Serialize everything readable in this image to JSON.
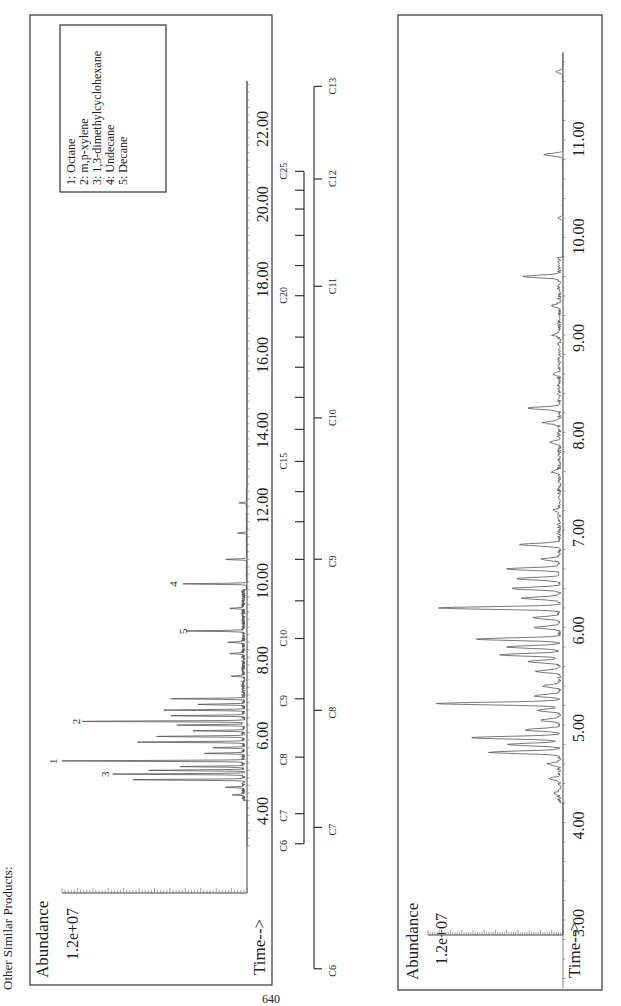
{
  "page": {
    "heading": "Other Similar Products:",
    "page_number": "640"
  },
  "chart_data": [
    {
      "type": "line",
      "title": "Total ion chromatogram (full run)",
      "ylabel": "Abundance",
      "xlabel": "Time-->",
      "y_tick_label": "1.2e+07",
      "ylim": [
        0,
        12000000
      ],
      "xlim": [
        3.0,
        23.3
      ],
      "x_ticks": [
        "4.00",
        "6.00",
        "8.00",
        "10.00",
        "12.00",
        "14.00",
        "16.00",
        "18.00",
        "20.00",
        "22.00"
      ],
      "legend": {
        "position": "top-right (rotated)",
        "entries": [
          "1: Octane",
          "2: m,p-xylene",
          "3: 1,3-dimethylcyclohexane",
          "4: Undecane",
          "5: Decane"
        ]
      },
      "labeled_peaks": [
        {
          "label": "1",
          "time": 5.25,
          "abundance": 12000000
        },
        {
          "label": "2",
          "time": 6.3,
          "abundance": 10500000
        },
        {
          "label": "3",
          "time": 4.9,
          "abundance": 8600000
        },
        {
          "label": "4",
          "time": 9.95,
          "abundance": 4200000
        },
        {
          "label": "5",
          "time": 8.7,
          "abundance": 3600000
        }
      ],
      "peaks": [
        {
          "time": 4.35,
          "abundance": 700000
        },
        {
          "time": 4.55,
          "abundance": 1200000
        },
        {
          "time": 4.75,
          "abundance": 7300000
        },
        {
          "time": 4.9,
          "abundance": 8600000
        },
        {
          "time": 5.0,
          "abundance": 6200000
        },
        {
          "time": 5.1,
          "abundance": 4000000
        },
        {
          "time": 5.25,
          "abundance": 12000000
        },
        {
          "time": 5.45,
          "abundance": 2600000
        },
        {
          "time": 5.6,
          "abundance": 2000000
        },
        {
          "time": 5.75,
          "abundance": 7000000
        },
        {
          "time": 5.9,
          "abundance": 5800000
        },
        {
          "time": 6.05,
          "abundance": 3200000
        },
        {
          "time": 6.2,
          "abundance": 4400000
        },
        {
          "time": 6.3,
          "abundance": 10500000
        },
        {
          "time": 6.45,
          "abundance": 4800000
        },
        {
          "time": 6.6,
          "abundance": 5100000
        },
        {
          "time": 6.75,
          "abundance": 3000000
        },
        {
          "time": 6.9,
          "abundance": 4600000
        },
        {
          "time": 7.5,
          "abundance": 800000
        },
        {
          "time": 8.1,
          "abundance": 900000
        },
        {
          "time": 8.4,
          "abundance": 1100000
        },
        {
          "time": 8.7,
          "abundance": 3600000
        },
        {
          "time": 9.3,
          "abundance": 900000
        },
        {
          "time": 9.95,
          "abundance": 4200000
        },
        {
          "time": 10.6,
          "abundance": 1400000
        },
        {
          "time": 11.3,
          "abundance": 600000
        },
        {
          "time": 12.1,
          "abundance": 500000
        }
      ],
      "carbon_scale": {
        "labels": [
          "C6",
          "C7",
          "C8",
          "C9",
          "C10",
          "C15",
          "C20",
          "C25"
        ],
        "positions_min": [
          3.05,
          3.85,
          5.35,
          6.9,
          8.5,
          13.2,
          17.6,
          20.9
        ],
        "minor_ticks_min": [
          9.5,
          10.6,
          11.6,
          12.4,
          14.05,
          14.9,
          15.7,
          16.5,
          18.4,
          19.2,
          19.9,
          20.4
        ]
      }
    },
    {
      "type": "line",
      "title": "Total ion chromatogram (expanded 3-11.8 min)",
      "ylabel": "Abundance",
      "xlabel": "Time-->",
      "y_tick_label": "1.2e+07",
      "ylim": [
        0,
        12000000
      ],
      "xlim": [
        2.3,
        11.9
      ],
      "x_ticks": [
        "3.00",
        "4.00",
        "5.00",
        "6.00",
        "7.00",
        "8.00",
        "9.00",
        "10.00",
        "11.00"
      ],
      "peaks": [
        {
          "time": 4.3,
          "abundance": 500000
        },
        {
          "time": 4.45,
          "abundance": 800000
        },
        {
          "time": 4.6,
          "abundance": 1000000
        },
        {
          "time": 4.72,
          "abundance": 6200000
        },
        {
          "time": 4.8,
          "abundance": 4600000
        },
        {
          "time": 4.87,
          "abundance": 8000000
        },
        {
          "time": 4.95,
          "abundance": 3000000
        },
        {
          "time": 5.05,
          "abundance": 1800000
        },
        {
          "time": 5.15,
          "abundance": 2100000
        },
        {
          "time": 5.22,
          "abundance": 11200000
        },
        {
          "time": 5.3,
          "abundance": 2300000
        },
        {
          "time": 5.4,
          "abundance": 1500000
        },
        {
          "time": 5.55,
          "abundance": 2000000
        },
        {
          "time": 5.65,
          "abundance": 2800000
        },
        {
          "time": 5.72,
          "abundance": 5300000
        },
        {
          "time": 5.8,
          "abundance": 4700000
        },
        {
          "time": 5.88,
          "abundance": 7300000
        },
        {
          "time": 6.0,
          "abundance": 2200000
        },
        {
          "time": 6.1,
          "abundance": 2400000
        },
        {
          "time": 6.2,
          "abundance": 10600000
        },
        {
          "time": 6.3,
          "abundance": 3300000
        },
        {
          "time": 6.4,
          "abundance": 4300000
        },
        {
          "time": 6.5,
          "abundance": 3800000
        },
        {
          "time": 6.6,
          "abundance": 4600000
        },
        {
          "time": 6.7,
          "abundance": 1600000
        },
        {
          "time": 6.85,
          "abundance": 3500000
        },
        {
          "time": 7.2,
          "abundance": 500000
        },
        {
          "time": 7.6,
          "abundance": 700000
        },
        {
          "time": 7.9,
          "abundance": 800000
        },
        {
          "time": 8.1,
          "abundance": 1400000
        },
        {
          "time": 8.25,
          "abundance": 2800000
        },
        {
          "time": 8.6,
          "abundance": 500000
        },
        {
          "time": 9.0,
          "abundance": 600000
        },
        {
          "time": 9.3,
          "abundance": 700000
        },
        {
          "time": 9.6,
          "abundance": 3200000
        },
        {
          "time": 10.2,
          "abundance": 400000
        },
        {
          "time": 10.85,
          "abundance": 1700000
        },
        {
          "time": 11.7,
          "abundance": 600000
        }
      ],
      "carbon_scale": {
        "labels": [
          "C6",
          "C7",
          "C8",
          "C9",
          "C10",
          "C11",
          "C12",
          "C13"
        ],
        "positions_min": [
          2.5,
          3.95,
          5.15,
          6.7,
          8.15,
          9.5,
          10.6,
          11.55
        ]
      }
    }
  ]
}
